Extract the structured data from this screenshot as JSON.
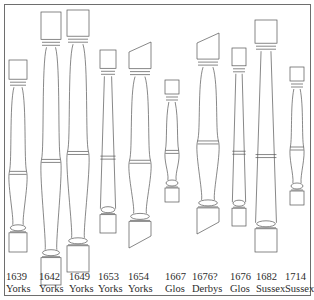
{
  "figure": {
    "stroke_color": "#555555",
    "border_color": "#6e6e6e"
  },
  "balusters": [
    {
      "date": "1639",
      "place": "Yorks",
      "cx": 18,
      "top": 60,
      "bottom": 252,
      "w": 18,
      "style": "short"
    },
    {
      "date": "1642",
      "place": "Yorks",
      "cx": 51,
      "top": 12,
      "bottom": 285,
      "w": 20,
      "style": "tall-vase"
    },
    {
      "date": "1649",
      "place": "Yorks",
      "cx": 78,
      "top": 10,
      "bottom": 272,
      "w": 22,
      "style": "tall-vase"
    },
    {
      "date": "1653",
      "place": "Yorks",
      "cx": 108,
      "top": 50,
      "bottom": 233,
      "w": 16,
      "style": "tapered"
    },
    {
      "date": "1654",
      "place": "Yorks",
      "cx": 140,
      "top": 42,
      "bottom": 248,
      "w": 22,
      "style": "raked"
    },
    {
      "date": "1667",
      "place": "Glos",
      "cx": 172,
      "top": 80,
      "bottom": 202,
      "w": 14,
      "style": "short"
    },
    {
      "date": "1676?",
      "place": "Derbys",
      "cx": 208,
      "top": 33,
      "bottom": 234,
      "w": 22,
      "style": "raked-vase"
    },
    {
      "date": "1676",
      "place": "Glos",
      "cx": 239,
      "top": 48,
      "bottom": 226,
      "w": 14,
      "style": "tapered"
    },
    {
      "date": "1682",
      "place": "Sussex",
      "cx": 266,
      "top": 20,
      "bottom": 252,
      "w": 22,
      "style": "tapered-tall"
    },
    {
      "date": "1714",
      "place": "Sussex",
      "cx": 297,
      "top": 67,
      "bottom": 205,
      "w": 14,
      "style": "short"
    }
  ],
  "labels": [
    {
      "date": "1639",
      "place": "Yorks",
      "x": 6
    },
    {
      "date": "1642",
      "place": "Yorks",
      "x": 39
    },
    {
      "date": "1649",
      "place": "Yorks",
      "x": 69
    },
    {
      "date": "1653",
      "place": "Yorks",
      "x": 98
    },
    {
      "date": "1654",
      "place": "Yorks",
      "x": 128
    },
    {
      "date": "1667",
      "place": "Glos",
      "x": 165
    },
    {
      "date": "1676?",
      "place": "Derbys",
      "x": 192
    },
    {
      "date": "1676",
      "place": "Glos",
      "x": 230
    },
    {
      "date": "1682",
      "place": "Sussex",
      "x": 256
    },
    {
      "date": "1714",
      "place": "Sussex",
      "x": 285
    }
  ]
}
